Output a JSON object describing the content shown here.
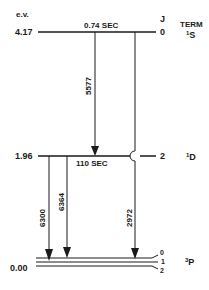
{
  "diagram": {
    "type": "energy-level-diagram",
    "axis_label": "e.v.",
    "column_headers": {
      "j": "J",
      "term": "TERM"
    },
    "levels": [
      {
        "energy": "4.17",
        "lifetime": "0.74 SEC",
        "j": "0",
        "term_sup": "1",
        "term": "S"
      },
      {
        "energy": "1.96",
        "lifetime": "110 SEC",
        "j": "2",
        "term_sup": "1",
        "term": "D"
      },
      {
        "energy": "0.00",
        "lifetime": "",
        "j_values": [
          "0",
          "1",
          "2"
        ],
        "term_sup": "3",
        "term": "P"
      }
    ],
    "transitions": [
      {
        "wavelength": "5577",
        "from": "1S",
        "to": "1D"
      },
      {
        "wavelength": "2972",
        "from": "1S",
        "to": "3P"
      },
      {
        "wavelength": "6300",
        "from": "1D",
        "to": "3P"
      },
      {
        "wavelength": "6364",
        "from": "1D",
        "to": "3P"
      }
    ],
    "line_color": "#1a1a1a"
  }
}
